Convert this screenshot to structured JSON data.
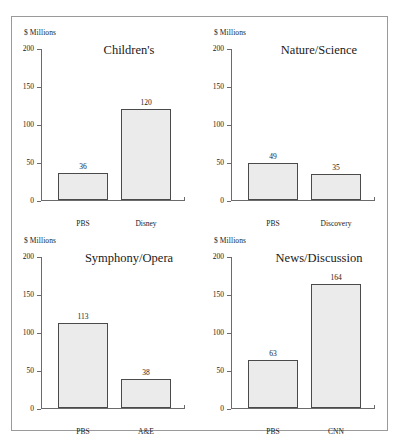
{
  "figure": {
    "axis_unit_label": "$ Millions",
    "y_ticks": [
      "200",
      "150",
      "100",
      "50",
      "0"
    ],
    "bar_fill_color": "#ebebeb",
    "bar_border_color": "#4a4a4a",
    "axis_color": "#6b6b6b",
    "frame_color": "#9a9a9a"
  },
  "chart_data": [
    {
      "type": "bar",
      "title": "Children's",
      "categories": [
        "PBS",
        "Disney"
      ],
      "values": [
        36,
        120
      ],
      "value_labels": [
        "36",
        "120"
      ],
      "xlabel": "",
      "ylabel": "$ Millions",
      "ylim": [
        0,
        200
      ],
      "yticks": [
        0,
        50,
        100,
        150,
        200
      ],
      "grid": false,
      "legend": "none"
    },
    {
      "type": "bar",
      "title": "Nature/Science",
      "categories": [
        "PBS",
        "Discovery"
      ],
      "values": [
        49,
        35
      ],
      "value_labels": [
        "49",
        "35"
      ],
      "xlabel": "",
      "ylabel": "$ Millions",
      "ylim": [
        0,
        200
      ],
      "yticks": [
        0,
        50,
        100,
        150,
        200
      ],
      "grid": false,
      "legend": "none"
    },
    {
      "type": "bar",
      "title": "Symphony/Opera",
      "categories": [
        "PBS",
        "A&E"
      ],
      "values": [
        113,
        38
      ],
      "value_labels": [
        "113",
        "38"
      ],
      "xlabel": "",
      "ylabel": "$ Millions",
      "ylim": [
        0,
        200
      ],
      "yticks": [
        0,
        50,
        100,
        150,
        200
      ],
      "grid": false,
      "legend": "none"
    },
    {
      "type": "bar",
      "title": "News/Discussion",
      "categories": [
        "PBS",
        "CNN"
      ],
      "values": [
        63,
        164
      ],
      "value_labels": [
        "63",
        "164"
      ],
      "xlabel": "",
      "ylabel": "$ Millions",
      "ylim": [
        0,
        200
      ],
      "yticks": [
        0,
        50,
        100,
        150,
        200
      ],
      "grid": false,
      "legend": "none"
    }
  ]
}
